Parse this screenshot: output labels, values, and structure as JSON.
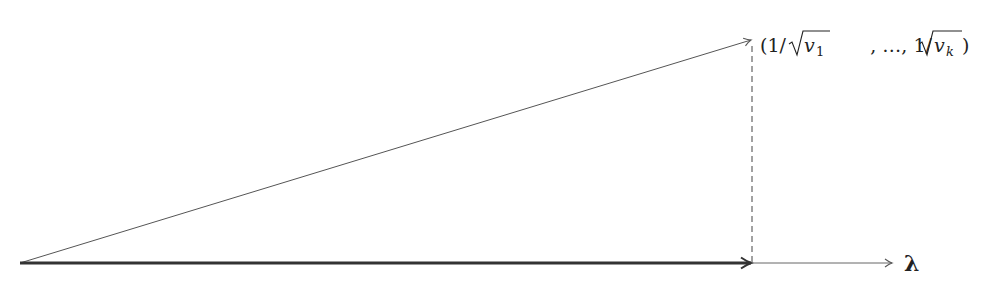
{
  "diagram": {
    "type": "vector-projection",
    "origin": [
      20,
      263
    ],
    "vectors": [
      {
        "name": "diagonal",
        "from": [
          20,
          263
        ],
        "to": [
          752,
          40
        ],
        "style": "thin",
        "color": "#555555"
      },
      {
        "name": "lambda-segment",
        "from": [
          20,
          263
        ],
        "to": [
          752,
          263
        ],
        "style": "thick",
        "color": "#333333"
      },
      {
        "name": "lambda-axis",
        "from": [
          752,
          263
        ],
        "to": [
          893,
          263
        ],
        "style": "thin",
        "color": "#666666"
      }
    ],
    "dashed_line": {
      "from": [
        752,
        44
      ],
      "to": [
        752,
        263
      ],
      "color": "#444444"
    },
    "labels": {
      "endpoint": "(1/√v₁, …, 1/√v_k)",
      "endpoint_parts": {
        "open": "(1/",
        "v1_base": "v",
        "v1_sub": "1",
        "middle": ", …, 1/",
        "vk_base": "v",
        "vk_sub": "k",
        "close": ")"
      },
      "axis": "λ"
    }
  }
}
